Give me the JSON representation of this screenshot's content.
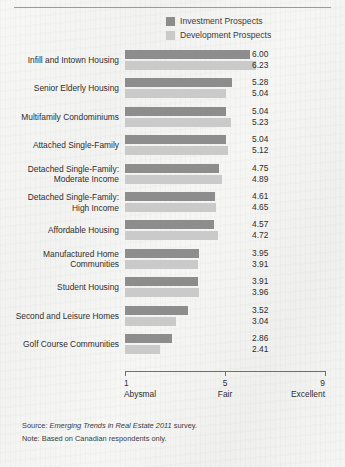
{
  "chart_data": {
    "type": "bar",
    "orientation": "horizontal",
    "title": "",
    "xlabel": "",
    "ylabel": "",
    "xlim": [
      1,
      9
    ],
    "grid": false,
    "legend_position": "top-center",
    "categories": [
      "Infill and Intown Housing",
      "Senior Elderly Housing",
      "Multifamily Condominiums",
      "Attached Single-Family",
      "Detached Single-Family: Moderate Income",
      "Detached Single-Family: High Income",
      "Affordable Housing",
      "Manufactured Home Communities",
      "Student Housing",
      "Second and Leisure Homes",
      "Golf Course Communities"
    ],
    "category_lines": [
      [
        "Infill and Intown Housing"
      ],
      [
        "Senior Elderly Housing"
      ],
      [
        "Multifamily Condominiums"
      ],
      [
        "Attached Single-Family"
      ],
      [
        "Detached Single-Family:",
        "Moderate Income"
      ],
      [
        "Detached Single-Family:",
        "High Income"
      ],
      [
        "Affordable Housing"
      ],
      [
        "Manufactured Home",
        "Communities"
      ],
      [
        "Student Housing"
      ],
      [
        "Second and Leisure Homes"
      ],
      [
        "Golf Course Communities"
      ]
    ],
    "series": [
      {
        "name": "Investment Prospects",
        "color": "#8d8d8d",
        "values": [
          6.0,
          5.28,
          5.04,
          5.04,
          4.75,
          4.61,
          4.57,
          3.95,
          3.91,
          3.52,
          2.86
        ],
        "value_labels": [
          "6.00",
          "5.28",
          "5.04",
          "5.04",
          "4.75",
          "4.61",
          "4.57",
          "3.95",
          "3.91",
          "3.52",
          "2.86"
        ]
      },
      {
        "name": "Development Prospects",
        "color": "#cacaca",
        "values": [
          6.23,
          5.04,
          5.23,
          5.12,
          4.89,
          4.65,
          4.72,
          3.91,
          3.96,
          3.04,
          2.41
        ],
        "value_labels": [
          "6.23",
          "5.04",
          "5.23",
          "5.12",
          "4.89",
          "4.65",
          "4.72",
          "3.91",
          "3.96",
          "3.04",
          "2.41"
        ]
      }
    ],
    "xticks": [
      {
        "value": 1,
        "number": "1",
        "text": "Abysmal"
      },
      {
        "value": 5,
        "number": "5",
        "text": "Fair"
      },
      {
        "value": 9,
        "number": "9",
        "text": "Excellent"
      }
    ]
  },
  "legend": {
    "items": [
      {
        "label": "Investment Prospects",
        "swatch": "investment"
      },
      {
        "label": "Development Prospects",
        "swatch": "development"
      }
    ]
  },
  "footnotes": {
    "source_prefix": "Source: ",
    "source_italic": "Emerging Trends in Real Estate 2011",
    "source_suffix": " survey.",
    "note": "Note: Based on Canadian respondents only."
  }
}
